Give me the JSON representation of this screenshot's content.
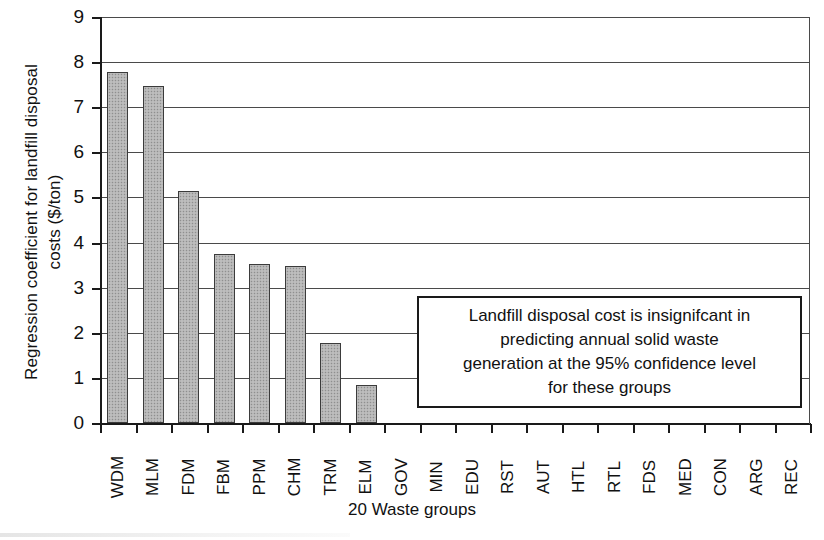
{
  "chart_data": {
    "type": "bar",
    "title": "",
    "xlabel": "20 Waste groups",
    "ylabel_lines": [
      "Regression coefficient for landfill disposal",
      "costs ($/ton)"
    ],
    "ylabel": "Regression coefficient for landfill disposal costs ($/ton)",
    "categories": [
      "WDM",
      "MLM",
      "FDM",
      "FBM",
      "PPM",
      "CHM",
      "TRM",
      "ELM",
      "GOV",
      "MIN",
      "EDU",
      "RST",
      "AUT",
      "HTL",
      "RTL",
      "FDS",
      "MED",
      "CON",
      "ARG",
      "REC"
    ],
    "values": [
      7.78,
      7.48,
      5.15,
      3.75,
      3.52,
      3.47,
      1.77,
      0.84,
      0,
      0,
      0,
      0,
      0,
      0,
      0,
      0,
      0,
      0,
      0,
      0
    ],
    "ylim": [
      0,
      9
    ],
    "yticks": [
      0,
      1,
      2,
      3,
      4,
      5,
      6,
      7,
      8,
      9
    ],
    "ytick_labels": [
      "0",
      "1",
      "2",
      "3",
      "4",
      "5",
      "6",
      "7",
      "8",
      "9"
    ],
    "grid": true,
    "grid_axis": "y",
    "legend": false,
    "bar_fill_color": "#b4b4b4",
    "bar_edge_color": "#3b3b3b",
    "axis_color": "#1a1a1a",
    "grid_color": "#4a4a4a",
    "background_color": "#ffffff",
    "annotations": [
      {
        "name": "insignificance-note",
        "lines": [
          "Landfill disposal cost is insignifcant in",
          "predicting annual solid waste",
          "generation at the 95% confidence level",
          "for these groups"
        ],
        "text": "Landfill disposal cost is insignifcant in predicting annual solid waste generation at the 95% confidence level for these groups",
        "boxed": true
      }
    ]
  }
}
